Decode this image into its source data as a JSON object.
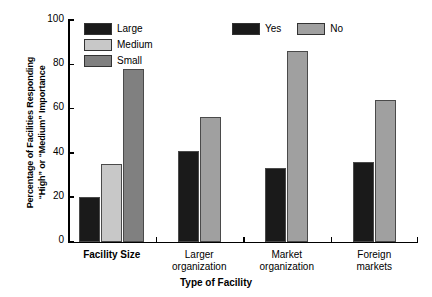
{
  "chart_data": {
    "type": "bar",
    "title": "",
    "xlabel": "Type of Facility",
    "ylabel": "Percentage of Facilities Responding\n“High” or “Medium” Importance",
    "ylim": [
      0,
      100
    ],
    "yticks": [
      0,
      20,
      40,
      60,
      80,
      100
    ],
    "grid": false,
    "categories": [
      "Facility Size",
      "Larger organization",
      "Market organization",
      "Foreign markets"
    ],
    "groups": [
      {
        "category": "Facility Size",
        "label_lines": "Facility Size",
        "bold": true,
        "bars": [
          {
            "name": "Large",
            "value": 20,
            "color": "#1a1a1a"
          },
          {
            "name": "Medium",
            "value": 35,
            "color": "#c8c8c8"
          },
          {
            "name": "Small",
            "value": 78,
            "color": "#808080"
          }
        ]
      },
      {
        "category": "Larger organization",
        "label_lines": "Larger\norganization",
        "bold": false,
        "bars": [
          {
            "name": "Yes",
            "value": 41,
            "color": "#1a1a1a"
          },
          {
            "name": "No",
            "value": 56,
            "color": "#a0a0a0"
          }
        ]
      },
      {
        "category": "Market organization",
        "label_lines": "Market\norganization",
        "bold": false,
        "bars": [
          {
            "name": "Yes",
            "value": 33,
            "color": "#1a1a1a"
          },
          {
            "name": "No",
            "value": 86,
            "color": "#a0a0a0"
          }
        ]
      },
      {
        "category": "Foreign markets",
        "label_lines": "Foreign\nmarkets",
        "bold": false,
        "bars": [
          {
            "name": "Yes",
            "value": 36,
            "color": "#1a1a1a"
          },
          {
            "name": "No",
            "value": 64,
            "color": "#a0a0a0"
          }
        ]
      }
    ],
    "legends": [
      {
        "id": "facility-size",
        "orientation": "vertical",
        "entries": [
          {
            "label": "Large",
            "color": "#1a1a1a"
          },
          {
            "label": "Medium",
            "color": "#c8c8c8"
          },
          {
            "label": "Small",
            "color": "#808080"
          }
        ]
      },
      {
        "id": "yes-no",
        "orientation": "horizontal",
        "entries": [
          {
            "label": "Yes",
            "color": "#1a1a1a"
          },
          {
            "label": "No",
            "color": "#a0a0a0"
          }
        ]
      }
    ]
  }
}
